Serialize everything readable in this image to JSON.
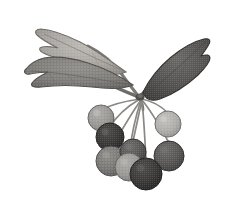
{
  "image": {
    "kind": "botanical-illustration",
    "subject": "berry cluster with leaves",
    "technique": "halftone engraving",
    "palette": "grayscale",
    "background_color": "#ffffff",
    "width": 228,
    "height": 203,
    "alt_text": "Grayscale halftone botanical illustration of a branch with three leaves and a drooping cluster of round berries"
  },
  "colors": {
    "background": "#ffffff",
    "leaf_light": "#a7a49f",
    "leaf_light_shade": "#8e8b86",
    "leaf_mid": "#7c7a76",
    "leaf_mid_shade": "#676561",
    "leaf_dark": "#595754",
    "leaf_dark_shade": "#434140",
    "stem": "#7e7c78",
    "stem_dark": "#5d5b58",
    "berry_lightest": "#b0aeaa",
    "berry_light": "#9a9894",
    "berry_mid": "#7a7875",
    "berry_dark": "#5a5855",
    "berry_darkest": "#3b3a38",
    "outline": "#4a4845"
  },
  "structure": {
    "node": {
      "label": "stem-junction",
      "x": 140,
      "y": 97
    },
    "leaves": [
      {
        "name": "upper-left-leaf",
        "tone": "light",
        "tip_x": 38,
        "tip_y": 30,
        "base_x": 126,
        "base_y": 72
      },
      {
        "name": "lower-left-leaf",
        "tone": "mid",
        "tip_x": 24,
        "tip_y": 72,
        "base_x": 131,
        "base_y": 84
      },
      {
        "name": "right-leaf",
        "tone": "dark",
        "tip_x": 206,
        "tip_y": 38,
        "base_x": 142,
        "base_y": 92
      }
    ],
    "berries": [
      {
        "name": "berry-upper-left",
        "cx": 101,
        "cy": 118,
        "r": 13,
        "tone": "light"
      },
      {
        "name": "berry-left-upper",
        "cx": 110,
        "cy": 137,
        "r": 14,
        "tone": "darkest"
      },
      {
        "name": "berry-left-lower",
        "cx": 111,
        "cy": 161,
        "r": 15,
        "tone": "mid"
      },
      {
        "name": "berry-center-left",
        "cx": 129,
        "cy": 167,
        "r": 14,
        "tone": "light"
      },
      {
        "name": "berry-center-lower",
        "cx": 146,
        "cy": 174,
        "r": 16,
        "tone": "darkest"
      },
      {
        "name": "berry-center-mid",
        "cx": 133,
        "cy": 152,
        "r": 13,
        "tone": "dark"
      },
      {
        "name": "berry-right-lower",
        "cx": 169,
        "cy": 156,
        "r": 15,
        "tone": "dark"
      },
      {
        "name": "berry-upper-right",
        "cx": 168,
        "cy": 124,
        "r": 13,
        "tone": "lightest"
      }
    ],
    "pedicels": [
      {
        "name": "pedicel-to-upper-left",
        "to_x": 101,
        "to_y": 110
      },
      {
        "name": "pedicel-to-left-upper",
        "to_x": 110,
        "to_y": 127
      },
      {
        "name": "pedicel-to-left-lower",
        "to_x": 111,
        "to_y": 149
      },
      {
        "name": "pedicel-to-center-left",
        "to_x": 129,
        "to_y": 155
      },
      {
        "name": "pedicel-to-center-mid",
        "to_x": 133,
        "to_y": 141
      },
      {
        "name": "pedicel-to-center-lower",
        "to_x": 146,
        "to_y": 160
      },
      {
        "name": "pedicel-to-right-lower",
        "to_x": 169,
        "to_y": 143
      },
      {
        "name": "pedicel-to-upper-right",
        "to_x": 168,
        "to_y": 113
      }
    ]
  }
}
